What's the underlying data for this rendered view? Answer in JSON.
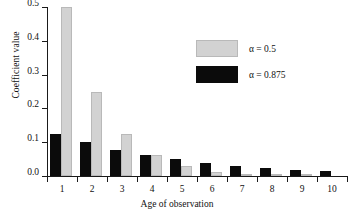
{
  "chart_data": {
    "type": "bar",
    "title": "",
    "xlabel": "Age of observation",
    "ylabel": "Coefficient value",
    "categories": [
      "1",
      "2",
      "3",
      "4",
      "5",
      "6",
      "7",
      "8",
      "9",
      "10"
    ],
    "ylim": [
      0.0,
      0.5
    ],
    "yticks": [
      "0.0",
      "0.1",
      "0.2",
      "0.3",
      "0.4",
      "0.5"
    ],
    "ytick_values": [
      0.0,
      0.1,
      0.2,
      0.3,
      0.4,
      0.5
    ],
    "grid": false,
    "legend_position": "upper right",
    "series": [
      {
        "name": "α = 0.875",
        "color": "#0b0b0b",
        "values": [
          0.125,
          0.1,
          0.078,
          0.0625,
          0.049,
          0.039,
          0.03,
          0.024,
          0.018,
          0.014
        ]
      },
      {
        "name": "α = 0.5",
        "color": "#d2d2d2",
        "values": [
          0.5,
          0.25,
          0.125,
          0.0625,
          0.031,
          0.013,
          0.006,
          0.003,
          0.001,
          0.0
        ]
      }
    ]
  },
  "legend": {
    "items": [
      {
        "label": "α = 0.5",
        "swatch": "light"
      },
      {
        "label": "α = 0.875",
        "swatch": "dark"
      }
    ]
  },
  "axes": {
    "y_title": "Coefficient value",
    "x_title": "Age of observation"
  }
}
